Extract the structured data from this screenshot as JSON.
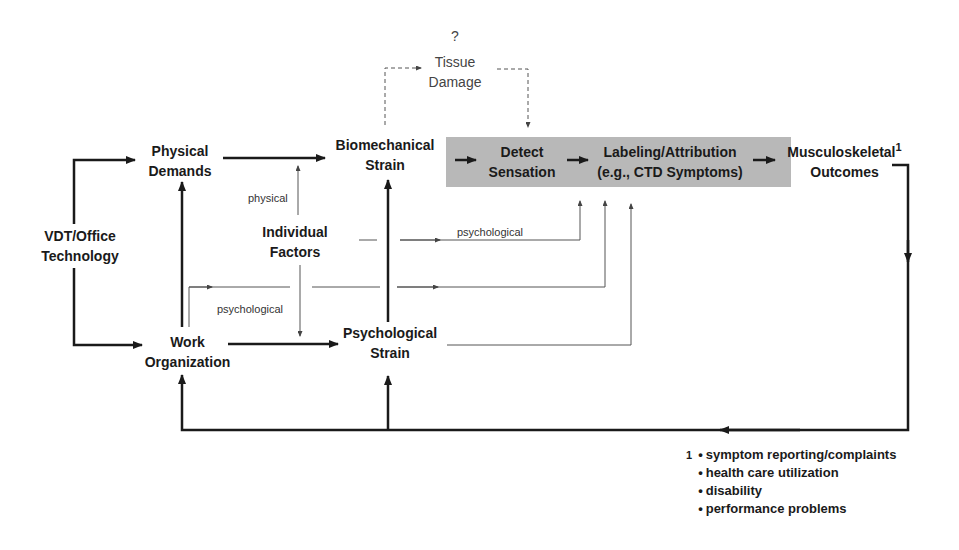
{
  "diagram": {
    "type": "conceptual-model",
    "nodes": {
      "vdt": {
        "line1": "VDT/Office",
        "line2": "Technology"
      },
      "physical_demands": {
        "line1": "Physical",
        "line2": "Demands"
      },
      "work_organization": {
        "line1": "Work",
        "line2": "Organization"
      },
      "individual_factors": {
        "line1": "Individual",
        "line2": "Factors"
      },
      "biomechanical_strain": {
        "line1": "Biomechanical",
        "line2": "Strain"
      },
      "psychological_strain": {
        "line1": "Psychological",
        "line2": "Strain"
      },
      "tissue_damage": {
        "question": "?",
        "line1": "Tissue",
        "line2": "Damage"
      },
      "detect_sensation": {
        "line1": "Detect",
        "line2": "Sensation"
      },
      "labeling": {
        "line1": "Labeling/Attribution",
        "line2": "(e.g., CTD Symptoms)"
      },
      "outcomes": {
        "line1": "Musculoskeletal",
        "line2": "Outcomes",
        "footnote_mark": "1"
      }
    },
    "edge_labels": {
      "physical": "physical",
      "psychological_upper": "psychological",
      "psychological_lower": "psychological"
    },
    "footnote": {
      "mark": "1",
      "items": [
        "symptom reporting/complaints",
        "health care utilization",
        "disability",
        "performance problems"
      ]
    },
    "colors": {
      "line": "#1a1a1a",
      "thin_line": "#555555",
      "shade": "#b8b8b8"
    }
  }
}
